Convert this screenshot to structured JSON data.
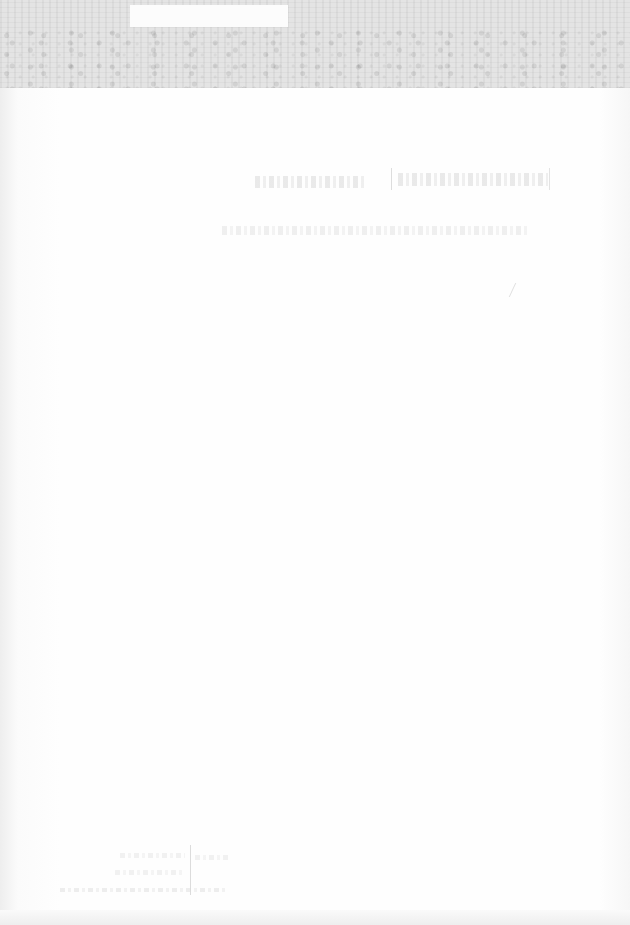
{
  "document": {
    "kind": "faded scanned page",
    "legibility": "text too faded to transcribe",
    "banner": {
      "label": ""
    },
    "title": "",
    "subtitle": "",
    "footer": {
      "lines": []
    }
  }
}
